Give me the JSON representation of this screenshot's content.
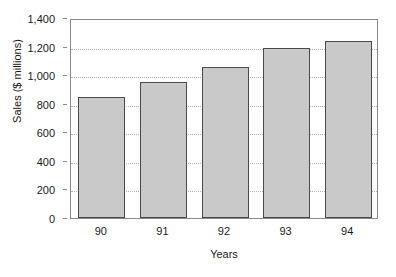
{
  "chart_data": {
    "type": "bar",
    "title": "",
    "subtitle": "",
    "xlabel": "Years",
    "ylabel": "Sales ($ millions)",
    "categories": [
      "90",
      "91",
      "92",
      "93",
      "94"
    ],
    "values": [
      850,
      950,
      1060,
      1190,
      1240
    ],
    "series": [
      {
        "name": "Sales",
        "values": [
          850,
          950,
          1060,
          1190,
          1240
        ]
      }
    ],
    "ylim": [
      0,
      1400
    ],
    "ytick_values": [
      0,
      200,
      400,
      600,
      800,
      1000,
      1200,
      1400
    ],
    "ytick_labels": [
      "0",
      "200",
      "400",
      "600",
      "800",
      "1,000",
      "1,200",
      "1,400"
    ],
    "xtick_labels": [
      "90",
      "91",
      "92",
      "93",
      "94"
    ],
    "grid": "horizontal-dotted",
    "legend": "none",
    "annotations": [],
    "colors": {
      "bar_fill": "#c9c9c9",
      "bar_border": "#4a4a4a",
      "gridline": "#b4b4b4",
      "axis_frame": "#8a8a8a",
      "text": "#111111",
      "background": "#ffffff"
    }
  }
}
